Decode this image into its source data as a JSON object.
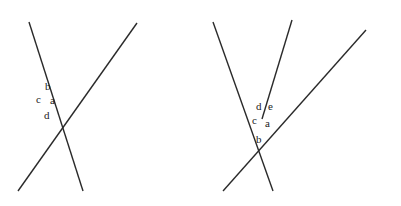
{
  "figures": [
    {
      "name": "left-figure",
      "intersection": [
        46,
        98
      ],
      "lines": [
        {
          "x1": 29,
          "y1": 22,
          "x2": 83,
          "y2": 191
        },
        {
          "x1": 18,
          "y1": 191,
          "x2": 137,
          "y2": 23
        }
      ],
      "labels": [
        {
          "text": "b",
          "x": 45,
          "y": 90
        },
        {
          "text": "c",
          "x": 36,
          "y": 103
        },
        {
          "text": "a",
          "x": 50,
          "y": 104
        },
        {
          "text": "d",
          "x": 44,
          "y": 119
        }
      ]
    },
    {
      "name": "right-figure",
      "intersection": [
        262,
        119
      ],
      "lines": [
        {
          "x1": 213,
          "y1": 22,
          "x2": 273,
          "y2": 191
        },
        {
          "x1": 292,
          "y1": 20,
          "x2": 262,
          "y2": 119
        },
        {
          "x1": 223,
          "y1": 191,
          "x2": 366,
          "y2": 30
        }
      ],
      "labels": [
        {
          "text": "d",
          "x": 256,
          "y": 110
        },
        {
          "text": "e",
          "x": 268,
          "y": 110
        },
        {
          "text": "c",
          "x": 252,
          "y": 124
        },
        {
          "text": "a",
          "x": 265,
          "y": 127
        },
        {
          "text": "b",
          "x": 256,
          "y": 143
        }
      ]
    }
  ]
}
